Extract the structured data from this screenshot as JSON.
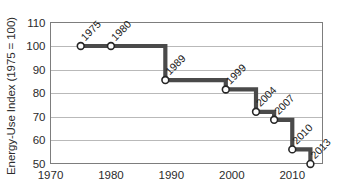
{
  "chart_data": {
    "type": "line",
    "subtype": "step",
    "title": "",
    "subtitle": "",
    "xlabel": "",
    "ylabel": "Energy-Use Index (1975 = 100)",
    "xlim": [
      1970,
      2015
    ],
    "ylim": [
      50,
      110
    ],
    "x_ticks": [
      1970,
      1980,
      1990,
      2000,
      2010
    ],
    "x_tick_labels": [
      "1970",
      "1980",
      "1990",
      "2000",
      "2010"
    ],
    "y_ticks": [
      50,
      60,
      70,
      80,
      90,
      100,
      110
    ],
    "y_tick_labels": [
      "50",
      "60",
      "70",
      "80",
      "90",
      "100",
      "110"
    ],
    "grid": true,
    "grid_axis": "y",
    "legend": false,
    "legend_position": "none",
    "marker": "open-circle",
    "line_color": "#4a4a4a",
    "marker_face_color": "#ffffff",
    "marker_edge_color": "#262626",
    "grid_color": "#b9b9b9",
    "frame_color": "#7d7d7d",
    "x": [
      1975,
      1980,
      1989,
      1999,
      2004,
      2007,
      2010,
      2013
    ],
    "values": [
      100,
      100,
      85.5,
      81.5,
      72,
      68.6,
      56,
      49.8
    ],
    "point_labels": [
      "1975",
      "1980",
      "1989",
      "1999",
      "2004",
      "2007",
      "2010",
      "2013"
    ],
    "point_label_rotation": -45,
    "series": [
      {
        "name": "Energy-Use Index",
        "x": [
          1975,
          1980,
          1989,
          1999,
          2004,
          2007,
          2010,
          2013
        ],
        "values": [
          100,
          100,
          85.5,
          81.5,
          72,
          68.6,
          56,
          49.8
        ]
      }
    ],
    "annotations": []
  }
}
